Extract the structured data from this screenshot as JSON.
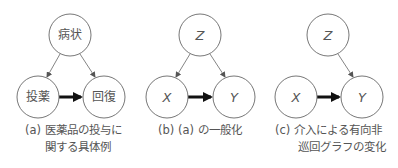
{
  "diagrams": [
    {
      "id": "a",
      "nodes": {
        "top": "病状",
        "left": "投薬",
        "right": "回復"
      },
      "caption_line1": "(a) 医薬品の投与に",
      "caption_line2": "関する具体例"
    },
    {
      "id": "b",
      "nodes": {
        "top": "Z",
        "left": "X",
        "right": "Y"
      },
      "caption_line1": "(b) (a) の一般化",
      "caption_line2": ""
    },
    {
      "id": "c",
      "nodes": {
        "top": "Z",
        "left": "X",
        "right": "Y"
      },
      "caption_line1": "(c) 介入による有向非",
      "caption_line2": "巡回グラフの変化"
    }
  ],
  "colors": {
    "node_stroke": "#777777",
    "thin_edge": "#666666",
    "thick_edge": "#111111",
    "text": "#555555"
  }
}
